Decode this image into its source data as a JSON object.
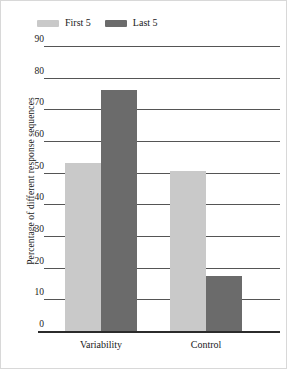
{
  "chart_data": {
    "type": "bar",
    "title": "",
    "xlabel": "",
    "ylabel": "Percentage of different response sequences",
    "categories": [
      "Variability",
      "Control"
    ],
    "series": [
      {
        "name": "First 5",
        "color": "#c9c9c9",
        "values": [
          53,
          50.5
        ]
      },
      {
        "name": "Last 5",
        "color": "#6b6b6b",
        "values": [
          76,
          17.5
        ]
      }
    ],
    "ylim": [
      0,
      90
    ],
    "yticks": [
      0,
      10,
      20,
      30,
      40,
      50,
      60,
      70,
      80,
      90
    ],
    "ytick_labels": [
      "0",
      "10",
      "20",
      "30",
      "40",
      "50",
      "60",
      "70",
      "80",
      "90"
    ],
    "grid": "horizontal",
    "legend_position": "top-left"
  },
  "legend": {
    "entries": [
      {
        "label": "First 5",
        "swatch_color": "#c9c9c9"
      },
      {
        "label": "Last 5",
        "swatch_color": "#6b6b6b"
      }
    ]
  },
  "axes": {
    "y_title": "Percentage of different response sequences"
  },
  "colors": {
    "first5": "#c9c9c9",
    "last5": "#6b6b6b",
    "gridline": "#555555",
    "baseline": "#2b2b2b",
    "frame": "#d8d8d8",
    "text": "#1a1a1a"
  }
}
